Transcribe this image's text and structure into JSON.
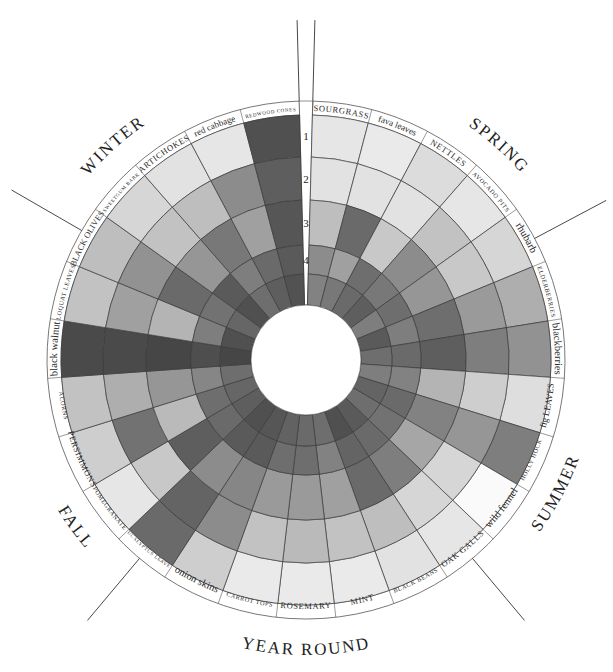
{
  "chart_data": {
    "type": "radial-heatmap",
    "title": "",
    "center": [
      306,
      360
    ],
    "ring_radii": [
      245,
      203,
      160,
      115,
      86,
      55
    ],
    "label_ring_outer": 259,
    "ring_numbers": [
      "1",
      "2",
      "3",
      "4"
    ],
    "seasons": [
      {
        "name": "WINTER",
        "angle": -42,
        "radius": 285
      },
      {
        "name": "SPRING",
        "angle": 42,
        "radius": 285
      },
      {
        "name": "SUMMER",
        "angle": 118,
        "radius": 280
      },
      {
        "name": "YEAR ROUND",
        "angle": 180,
        "radius": 285
      },
      {
        "name": "FALL",
        "angle": -126,
        "radius": 280
      }
    ],
    "season_dividers": [
      -1.5,
      1.5,
      62,
      140,
      -140,
      -60
    ],
    "gap": {
      "start": -1.5,
      "end": 1.5
    },
    "plants": [
      {
        "name": "SOURGRASS",
        "style": "caps",
        "shades": [
          0.1,
          0.12,
          0.3,
          0.55,
          0.6
        ]
      },
      {
        "name": "fava leaves",
        "style": "mixed",
        "shades": [
          0.08,
          0.12,
          0.72,
          0.45,
          0.65
        ]
      },
      {
        "name": "NETTLES",
        "style": "caps",
        "shades": [
          0.15,
          0.12,
          0.25,
          0.7,
          0.72
        ]
      },
      {
        "name": "AVOCADO PITS",
        "style": "small",
        "shades": [
          0.1,
          0.28,
          0.55,
          0.65,
          0.78
        ]
      },
      {
        "name": "rhubarb",
        "style": "lower",
        "shades": [
          0.18,
          0.25,
          0.5,
          0.7,
          0.62
        ]
      },
      {
        "name": "ELDERBERRIES",
        "style": "small",
        "shades": [
          0.38,
          0.48,
          0.7,
          0.62,
          0.8
        ]
      },
      {
        "name": "blackberries",
        "style": "lower",
        "shades": [
          0.52,
          0.62,
          0.78,
          0.72,
          0.7
        ]
      },
      {
        "name": "fig LEAVES",
        "style": "mixed",
        "shades": [
          0.14,
          0.22,
          0.35,
          0.6,
          0.62
        ]
      },
      {
        "name": "HOLLY HOCK",
        "style": "small",
        "shades": [
          0.62,
          0.5,
          0.6,
          0.72,
          0.75
        ]
      },
      {
        "name": "wild fennel",
        "style": "lower",
        "shades": [
          0.0,
          0.18,
          0.42,
          0.68,
          0.7
        ]
      },
      {
        "name": "OAK GALLS",
        "style": "caps",
        "shades": [
          0.1,
          0.18,
          0.62,
          0.72,
          0.8
        ]
      },
      {
        "name": "BLACK BEANS",
        "style": "small",
        "shades": [
          0.12,
          0.3,
          0.72,
          0.75,
          0.85
        ]
      },
      {
        "name": "MINT",
        "style": "caps",
        "shades": [
          0.08,
          0.28,
          0.45,
          0.6,
          0.7
        ]
      },
      {
        "name": "ROSEMARY",
        "style": "caps",
        "shades": [
          0.08,
          0.32,
          0.48,
          0.7,
          0.72
        ]
      },
      {
        "name": "CARROT TOPS",
        "style": "small",
        "shades": [
          0.08,
          0.28,
          0.48,
          0.7,
          0.76
        ]
      },
      {
        "name": "onion skins",
        "style": "lower",
        "shades": [
          0.22,
          0.55,
          0.58,
          0.8,
          0.82
        ]
      },
      {
        "name": "EUCALYPTUS LEAVES",
        "style": "tiny",
        "shades": [
          0.72,
          0.75,
          0.55,
          0.8,
          0.85
        ]
      },
      {
        "name": "POMEGRANATE",
        "style": "small",
        "shades": [
          0.1,
          0.25,
          0.78,
          0.72,
          0.78
        ]
      },
      {
        "name": "PERSIMMONS",
        "style": "caps",
        "shades": [
          0.22,
          0.68,
          0.32,
          0.7,
          0.74
        ]
      },
      {
        "name": "ACORNS",
        "style": "small",
        "shades": [
          0.28,
          0.38,
          0.5,
          0.58,
          0.7
        ]
      },
      {
        "name": "black walnut",
        "style": "lower",
        "shades": [
          0.88,
          0.88,
          0.9,
          0.86,
          0.9
        ]
      },
      {
        "name": "LOQUAT LEAVES",
        "style": "small",
        "shades": [
          0.28,
          0.45,
          0.35,
          0.62,
          0.85
        ]
      },
      {
        "name": "BLACK OLIVES",
        "style": "mixed2",
        "shades": [
          0.3,
          0.52,
          0.72,
          0.68,
          0.74
        ]
      },
      {
        "name": "SWEETGUM BARK",
        "style": "tiny",
        "shades": [
          0.18,
          0.28,
          0.5,
          0.8,
          0.85
        ]
      },
      {
        "name": "ARTICHOKES",
        "style": "caps",
        "shades": [
          0.12,
          0.3,
          0.65,
          0.62,
          0.7
        ]
      },
      {
        "name": "red cabbage",
        "style": "mixed",
        "shades": [
          0.1,
          0.55,
          0.45,
          0.72,
          0.78
        ]
      },
      {
        "name": "REDWOOD CONES",
        "style": "tiny",
        "shades": [
          0.85,
          0.78,
          0.82,
          0.8,
          0.84
        ]
      }
    ]
  }
}
